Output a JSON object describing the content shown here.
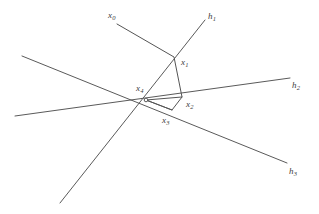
{
  "figure": {
    "type": "geometric-diagram",
    "background_color": "#ffffff",
    "line_color": "#5a5a5a",
    "label_color": "#3c3c3c",
    "width": 319,
    "height": 214
  },
  "points": [
    {
      "id": "x0",
      "base": "x",
      "sub": "0",
      "label_x": 108,
      "label_y": 11,
      "node_x": 117,
      "node_y": 24,
      "show_node": false
    },
    {
      "id": "x1",
      "base": "x",
      "sub": "1",
      "label_x": 181,
      "label_y": 58,
      "node_x": 174,
      "node_y": 57,
      "show_node": false
    },
    {
      "id": "x2",
      "base": "x",
      "sub": "2",
      "label_x": 186,
      "label_y": 100,
      "node_x": 182,
      "node_y": 97,
      "show_node": false
    },
    {
      "id": "x3",
      "base": "x",
      "sub": "3",
      "label_x": 162,
      "label_y": 116,
      "node_x": 172,
      "node_y": 110,
      "show_node": false
    },
    {
      "id": "x4",
      "base": "x",
      "sub": "4",
      "label_x": 136,
      "label_y": 84,
      "node_x": 146,
      "node_y": 100,
      "show_node": true
    }
  ],
  "lines": [
    {
      "id": "h1",
      "base": "h",
      "sub": "1",
      "label_x": 208,
      "label_y": 12,
      "x1": 205,
      "y1": 20,
      "x2": 60,
      "y2": 203
    },
    {
      "id": "h2",
      "base": "h",
      "sub": "2",
      "label_x": 292,
      "label_y": 81,
      "x1": 15,
      "y1": 116,
      "x2": 290,
      "y2": 78
    },
    {
      "id": "h3",
      "base": "h",
      "sub": "3",
      "label_x": 289,
      "label_y": 167,
      "x1": 22,
      "y1": 56,
      "x2": 287,
      "y2": 163
    }
  ],
  "path": {
    "id": "broken-path",
    "description": "polygonal path x0 to x1 to x2 to x3 to x4",
    "vertices": [
      {
        "x": 117,
        "y": 24
      },
      {
        "x": 174,
        "y": 57
      },
      {
        "x": 182,
        "y": 97
      },
      {
        "x": 172,
        "y": 110
      },
      {
        "x": 146,
        "y": 100
      }
    ]
  },
  "extra_segments": [
    {
      "id": "x4-to-x2",
      "x1": 146,
      "y1": 100,
      "x2": 182,
      "y2": 97
    },
    {
      "id": "x4-to-x3",
      "x1": 146,
      "y1": 100,
      "x2": 172,
      "y2": 110
    }
  ]
}
